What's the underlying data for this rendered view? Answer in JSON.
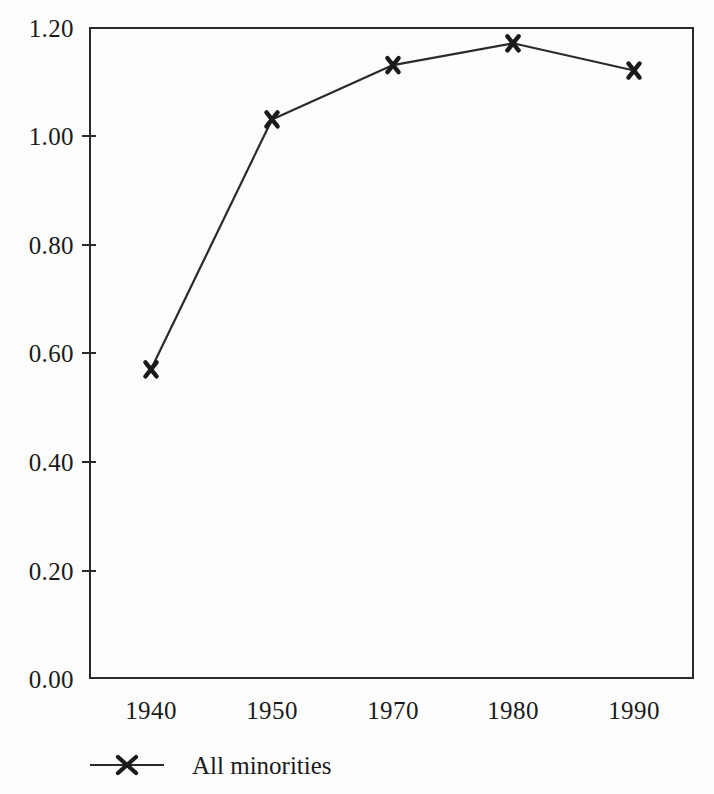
{
  "chart_data": {
    "type": "line",
    "title": "",
    "subtitle": "",
    "xlabel": "",
    "ylabel": "",
    "categories": [
      "1940",
      "1950",
      "1970",
      "1980",
      "1990"
    ],
    "series": [
      {
        "name": "All minorities",
        "marker": "x",
        "values": [
          0.57,
          1.03,
          1.13,
          1.17,
          1.12
        ]
      }
    ],
    "ylim": [
      0.0,
      1.2
    ],
    "ytick_labels": [
      "1.20",
      "1.00",
      "0.80",
      "0.60",
      "0.40",
      "0.20",
      "0.00"
    ],
    "ytick_values": [
      1.2,
      1.0,
      0.8,
      0.6,
      0.4,
      0.2,
      0.0
    ],
    "grid": false,
    "legend_position": "below-left",
    "annotations": []
  },
  "figure": {
    "line_color": "#2a2a2a",
    "marker_color": "#1a1a1a",
    "axis_color": "#2a2a2a",
    "background_color": "#fdfdfd"
  },
  "legend": {
    "entries": [
      {
        "label": "All minorities",
        "marker": "x-marker"
      }
    ]
  }
}
